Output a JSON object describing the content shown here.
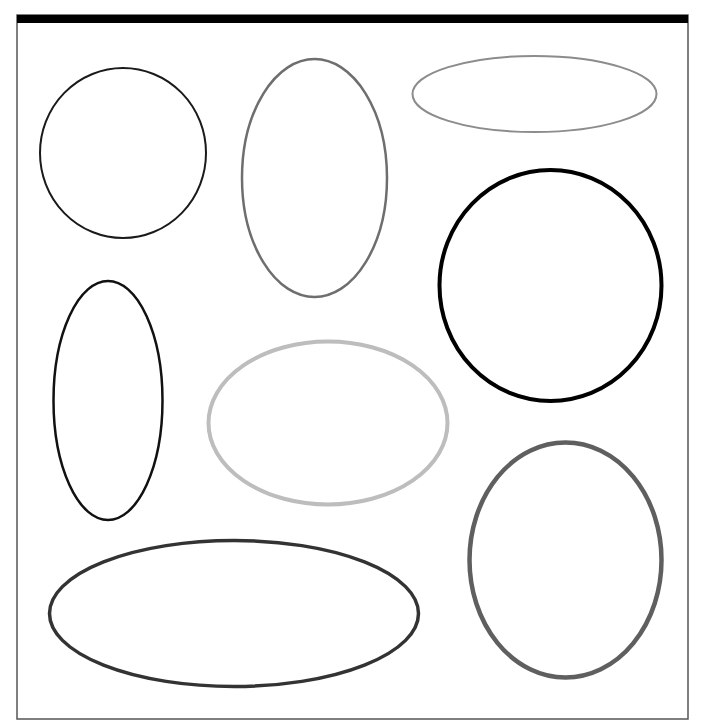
{
  "canvas": {
    "width": 709,
    "height": 728,
    "background": "#ffffff"
  },
  "frame": {
    "x": 17,
    "y": 15,
    "width": 671,
    "height": 704,
    "border_color": "#555555",
    "header_bar": {
      "height": 8,
      "color": "#000000"
    }
  },
  "shapes": [
    {
      "id": "circle-top-left",
      "cx": 123,
      "cy": 153,
      "rx": 83,
      "ry": 85,
      "stroke": "#1a1a1a",
      "stroke_width": 2
    },
    {
      "id": "ellipse-tall-top-mid",
      "cx": 314.5,
      "cy": 178,
      "rx": 72.5,
      "ry": 119,
      "stroke": "#6e6e6e",
      "stroke_width": 2.5
    },
    {
      "id": "ellipse-wide-top-right",
      "cx": 534.5,
      "cy": 94,
      "rx": 122,
      "ry": 38,
      "stroke": "#8c8c8c",
      "stroke_width": 2
    },
    {
      "id": "circle-right",
      "cx": 550.5,
      "cy": 285.5,
      "rx": 111,
      "ry": 115.5,
      "stroke": "#000000",
      "stroke_width": 4
    },
    {
      "id": "ellipse-tall-left",
      "cx": 108,
      "cy": 400.5,
      "rx": 54.5,
      "ry": 119.5,
      "stroke": "#111111",
      "stroke_width": 2.5
    },
    {
      "id": "ellipse-center",
      "cx": 328,
      "cy": 423,
      "rx": 119.5,
      "ry": 81.5,
      "stroke": "#bdbdbd",
      "stroke_width": 4
    },
    {
      "id": "ellipse-bottom-right",
      "cx": 565.5,
      "cy": 560,
      "rx": 96,
      "ry": 117.5,
      "stroke": "#5f5f5f",
      "stroke_width": 4.5
    },
    {
      "id": "ellipse-bottom-wide",
      "cx": 234,
      "cy": 613.5,
      "rx": 184.5,
      "ry": 73,
      "stroke": "#333333",
      "stroke_width": 3.5
    }
  ]
}
